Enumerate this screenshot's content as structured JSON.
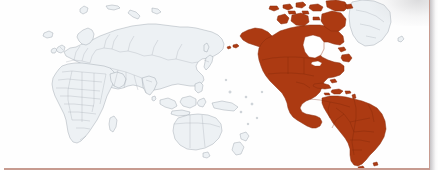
{
  "image": {
    "kind": "world-map-thematic",
    "title": "World map with the Americas highlighted",
    "alt_text": "Grey world map outline with North, Central and South America shaded in dark rust red",
    "medium": "scanned print",
    "width_px": 438,
    "height_px": 180
  },
  "colors": {
    "highlight_fill": "#ac3a12",
    "highlight_stroke": "#8a2c0c",
    "base_fill": "#edf1f4",
    "base_stroke": "#9aa3ad",
    "background": "#ffffff",
    "frame_rule": "#c79b90",
    "scan_shadow": "#969196"
  },
  "map": {
    "projection_note": "Pacific-centred world outline, Americas at right",
    "highlighted_regions": [
      "North America",
      "Canada",
      "United States",
      "Mexico",
      "Central America",
      "Caribbean",
      "South America",
      "Canadian Arctic Archipelago",
      "Alaska"
    ],
    "unhighlighted_regions": [
      "Europe",
      "Africa",
      "Asia",
      "Russia",
      "Middle East",
      "India",
      "China",
      "Southeast Asia",
      "Indonesia",
      "Australia",
      "New Zealand",
      "Japan",
      "Greenland",
      "Iceland",
      "British Isles",
      "Madagascar",
      "Philippines"
    ]
  },
  "frame": {
    "right_rule_visible": true,
    "bottom_rule_visible": true,
    "top_rule_visible": false,
    "left_rule_visible": false
  }
}
